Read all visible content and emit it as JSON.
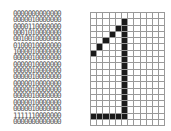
{
  "matrix": {
    "rows": 18,
    "cols": 12,
    "on_color": "#1a1a1a",
    "off_color": "#ffffff",
    "grid_line_color": "#999999",
    "values": [
      "000000000000",
      "000001000000",
      "000011000000",
      "000101000000",
      "001001000000",
      "010001000000",
      "100001000000",
      "000001000000",
      "000001000000",
      "000001000000",
      "000001000000",
      "000001000000",
      "000001000000",
      "000001000000",
      "000001000000",
      "000001000000",
      "111111000000",
      "000000000000"
    ]
  }
}
